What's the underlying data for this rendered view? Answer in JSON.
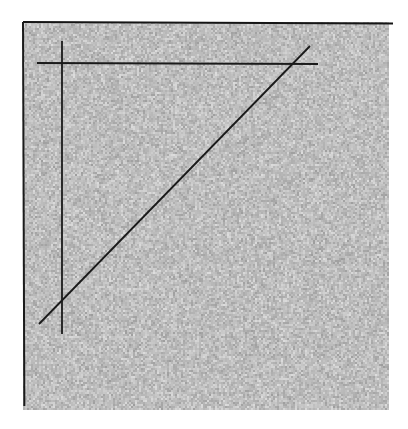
{
  "figure": {
    "title": "Noisy grayscale field with overlaid straight line segments",
    "page_background": "#ffffff",
    "canvas": {
      "width": 408,
      "height": 429
    }
  },
  "noise_panel": {
    "name": "random grayscale noise square",
    "x": 23,
    "y": 22,
    "width": 366,
    "height": 388,
    "fill_base_color": "#c3c3c3",
    "noise_min_gray": "#9c9c9c",
    "noise_max_gray": "#dedede",
    "noise_cell_px": 2,
    "seed": 20240517
  },
  "frame": {
    "edges": [
      {
        "name": "top-edge",
        "x1": 23,
        "y1": 22,
        "x2": 393,
        "y2": 23,
        "color": "#151515",
        "thickness": 2
      },
      {
        "name": "left-edge",
        "x1": 23,
        "y1": 22,
        "x2": 22,
        "y2": 406,
        "color": "#1b1b1b",
        "thickness": 2
      }
    ]
  },
  "chart_data": {
    "type": "line",
    "title": "Noisy grayscale field with overlaid straight line segments",
    "xlabel": "",
    "ylabel": "",
    "xlim": [
      0,
      408
    ],
    "ylim": [
      429,
      0
    ],
    "grid": false,
    "legend": "none",
    "background_texture": "uniform random grayscale noise",
    "series": [
      {
        "name": "vertical-axis-line",
        "stroke": "#1a1a1a",
        "width": 1.8,
        "x": [
          62,
          62
        ],
        "y": [
          41,
          334
        ]
      },
      {
        "name": "horizontal-axis-line",
        "stroke": "#1a1a1a",
        "width": 1.8,
        "x": [
          37,
          318
        ],
        "y": [
          63,
          64
        ]
      },
      {
        "name": "diagonal-line",
        "stroke": "#1a1a1a",
        "width": 1.8,
        "x": [
          39,
          310
        ],
        "y": [
          324,
          46
        ]
      }
    ],
    "annotations": []
  }
}
